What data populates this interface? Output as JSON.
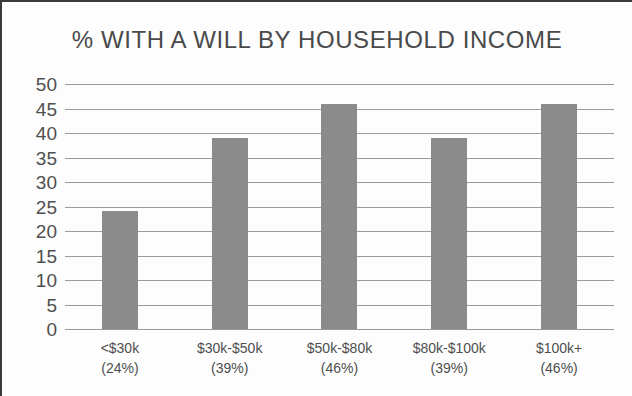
{
  "chart_data": {
    "type": "bar",
    "title": "% WITH A WILL BY HOUSEHOLD INCOME",
    "xlabel": "",
    "ylabel": "",
    "categories": [
      "<$30k",
      "$30k-$50k",
      "$50k-$80k",
      "$80k-$100k",
      "$100k+"
    ],
    "category_sublabels": [
      "(24%)",
      "(39%)",
      "(46%)",
      "(39%)",
      "(46%)"
    ],
    "values": [
      24,
      39,
      46,
      39,
      46
    ],
    "ylim": [
      0,
      50
    ],
    "ytick_labels": [
      "50",
      "45",
      "40",
      "35",
      "30",
      "25",
      "20",
      "15",
      "10",
      "5",
      "0"
    ],
    "ytick_values": [
      50,
      45,
      40,
      35,
      30,
      25,
      20,
      15,
      10,
      5,
      0
    ],
    "grid": true,
    "legend": false,
    "legend_position": "none",
    "bar_color": "#8b8b8b",
    "gridline_color": "#9a9a9a",
    "title_color": "#4a4a4a",
    "label_color": "#4f4f4f",
    "background_color": "#fdfdfd",
    "border_color": "#3a3a3a"
  }
}
